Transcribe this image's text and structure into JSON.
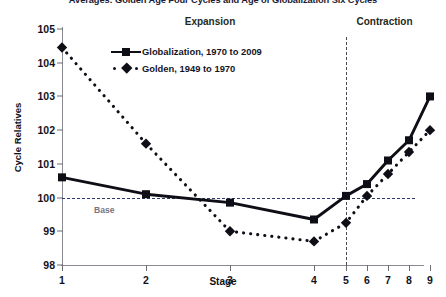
{
  "title": "Averages: Golden Age Four Cycles and Age of Globalization Six Cycles",
  "axes": {
    "ylabel": "Cycle Relatives",
    "xlabel": "Stage"
  },
  "annotations": {
    "expansion": "Expansion",
    "contraction": "Contraction",
    "base": "Base"
  },
  "legend": {
    "globalization": "Globalization, 1970 to 2009",
    "golden": "Golden, 1949 to 1970"
  },
  "colors": {
    "line": "#0e0e16",
    "baseline": "#2d3a66",
    "divider": "#4a4a55",
    "axis": "#8a8a90",
    "zone_text": "#1e2b1e"
  },
  "chart_data": {
    "type": "line",
    "title": "Averages: Golden Age Four Cycles and Age of Globalization Six Cycles",
    "xlabel": "Stage",
    "ylabel": "Cycle Relatives",
    "x": [
      1,
      2,
      3,
      4,
      5,
      6,
      7,
      8,
      9
    ],
    "xtick_labels": [
      "1",
      "2",
      "3",
      "4",
      "5",
      "6",
      "7",
      "8",
      "9"
    ],
    "xtick_positions": [
      0,
      84,
      168,
      252,
      284,
      305,
      326,
      347,
      368
    ],
    "ytick_labels": [
      "98",
      "99",
      "100",
      "101",
      "102",
      "103",
      "104",
      "105"
    ],
    "ylim": [
      98,
      105
    ],
    "ystep": 1,
    "grid": false,
    "legend_position": "upper-center",
    "baseline_value": 100,
    "divider_x_stage": 5,
    "series": [
      {
        "name": "Globalization, 1970 to 2009",
        "style": "solid",
        "marker": "square",
        "values": [
          100.6,
          100.1,
          99.85,
          99.35,
          100.05,
          100.4,
          101.1,
          101.7,
          103.0
        ]
      },
      {
        "name": "Golden, 1949 to 1970",
        "style": "dotted",
        "marker": "diamond",
        "values": [
          104.45,
          101.6,
          99.0,
          98.7,
          99.25,
          100.05,
          100.7,
          101.35,
          102.0
        ]
      }
    ]
  }
}
